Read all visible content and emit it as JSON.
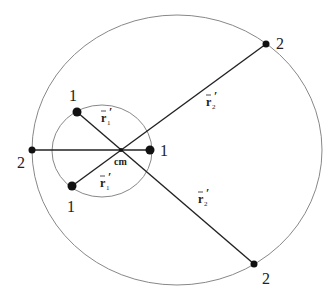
{
  "diagram": {
    "center_label": "cm",
    "center": {
      "x": 121,
      "y": 150
    },
    "inner_circle": {
      "cx": 102,
      "cy": 151,
      "rx": 50,
      "ry": 46,
      "color": "#888888"
    },
    "outer_circle": {
      "cx": 177,
      "cy": 150,
      "rx": 145,
      "ry": 135,
      "color": "#888888"
    },
    "body1_label": "1",
    "body2_label": "2",
    "body1_positions": [
      {
        "x": 77,
        "y": 112,
        "label": "1",
        "lx": 69,
        "ly": 101
      },
      {
        "x": 150,
        "y": 150,
        "label": "1",
        "lx": 160,
        "ly": 156
      },
      {
        "x": 72,
        "y": 186,
        "label": "1",
        "lx": 67,
        "ly": 212
      }
    ],
    "body2_positions": [
      {
        "x": 32,
        "y": 150,
        "label": "2",
        "lx": 17,
        "ly": 168
      },
      {
        "x": 266,
        "y": 44,
        "label": "2",
        "lx": 276,
        "ly": 44
      },
      {
        "x": 254,
        "y": 264,
        "label": "2",
        "lx": 262,
        "ly": 284
      }
    ],
    "vector_labels": {
      "r1_prime": "r",
      "r1_sub": "1",
      "r2_prime": "r",
      "r2_sub": "2",
      "prime": "′"
    },
    "line_color": "#222222",
    "dot_color": "#111111"
  }
}
